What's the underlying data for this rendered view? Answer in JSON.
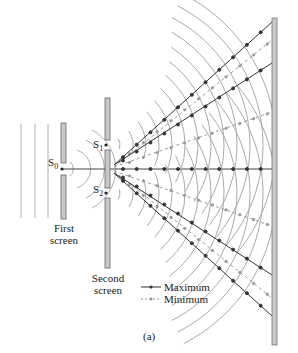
{
  "diagram": {
    "type": "double-slit interference",
    "sources": {
      "s0": {
        "label": "S",
        "sub": "0"
      },
      "s1": {
        "label": "S",
        "sub": "1"
      },
      "s2": {
        "label": "S",
        "sub": "2"
      }
    },
    "screens": {
      "first": {
        "line1": "First",
        "line2": "screen"
      },
      "second": {
        "line1": "Second",
        "line2": "screen"
      }
    },
    "legend": {
      "maximum": "Maximum",
      "minimum": "Minimum"
    },
    "caption": "(a)",
    "colors": {
      "wave": "#a8a8a8",
      "maximum_line": "#333333",
      "minimum_line": "#9a9a9a",
      "screen_fill": "#c8c8c8",
      "screen_stroke": "#666666"
    }
  }
}
